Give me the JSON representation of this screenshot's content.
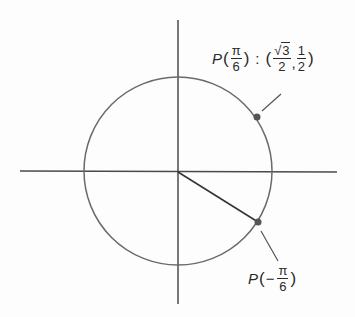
{
  "diagram": {
    "type": "unit-circle",
    "colors": {
      "line": "#4a4a4a",
      "circle": "#6a6a6a",
      "point": "#555555",
      "background": "#fdfdfd"
    },
    "points": [
      {
        "id": "p-pi-over-6",
        "label_prefix": "P",
        "arg_num": "π",
        "arg_den": "6",
        "separator": ":",
        "coord_x_num_root": "√",
        "coord_x_num_val": "3",
        "coord_x_den": "2",
        "comma": ",",
        "coord_y_num": "1",
        "coord_y_den": "2"
      },
      {
        "id": "p-minus-pi-over-6",
        "label_prefix": "P",
        "arg_sign": "−",
        "arg_num": "π",
        "arg_den": "6"
      }
    ],
    "parens": {
      "open": "(",
      "close": ")"
    }
  }
}
